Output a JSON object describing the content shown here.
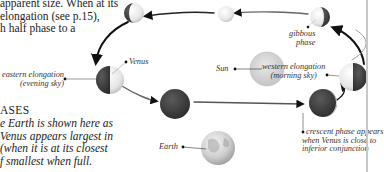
{
  "intro_text": {
    "lines": [
      "apparent size. When at its",
      " elongation (see p.15),",
      "h half phase to a"
    ]
  },
  "phases": {
    "title": "ASES",
    "caption_lines": [
      "e Earth is shown here as",
      "Venus appears largest in",
      "(when it is at its closest",
      "f smallest when full."
    ]
  },
  "labels": {
    "venus": "Venus",
    "sun": "Sun",
    "earth": "Earth",
    "gibbous": [
      "gibbous",
      "phase"
    ],
    "eastern": [
      "eastern elongation",
      "(evening sky)"
    ],
    "western": [
      "western elongation",
      "(morning sky)"
    ],
    "crescent": [
      "crescent phase appears",
      "when Venus is close to",
      "inferior conjunction"
    ]
  },
  "colors": {
    "dark_side": "#3a3a3a",
    "lit_side": "#f2f2f2",
    "orbit": "#1a1a1a",
    "sun": "#d4d4d4",
    "earth": "#c9c9c9",
    "divider": "#c8c8c8"
  }
}
